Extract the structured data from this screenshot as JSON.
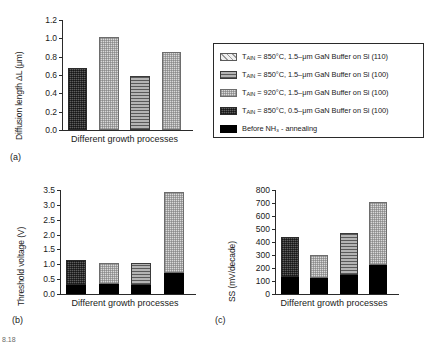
{
  "figure": {
    "panel_a_label": "(a)",
    "panel_b_label": "(b)",
    "panel_c_label": "(c)",
    "xaxis_caption": "Different growth processes",
    "footer_partial": "8.18"
  },
  "legend": {
    "entries": [
      {
        "pattern": "diagonal-hatch",
        "prefix": "T",
        "subscript": "AlN",
        "text": " = 850°C, 1.5–μm GaN Buffer on Si (110)"
      },
      {
        "pattern": "horizontal-lines",
        "prefix": "T",
        "subscript": "AlN",
        "text": " = 850°C, 1.5–μm GaN Buffer on Si (100)"
      },
      {
        "pattern": "checker",
        "prefix": "T",
        "subscript": "AlN",
        "text": " = 920°C, 1.5–μm GaN Buffer on Si (100)"
      },
      {
        "pattern": "dense-grid",
        "prefix": "T",
        "subscript": "AlN",
        "text": " = 850°C, 0.5–μm GaN Buffer on Si (100)"
      },
      {
        "pattern": "solid-black",
        "prefix": "",
        "subscript": "",
        "text": "Before NH₃ - annealing"
      }
    ]
  },
  "chart_data": [
    {
      "type": "bar",
      "panel": "a",
      "title": "",
      "xlabel": "Different growth processes",
      "ylabel": "Diffusion length ΔL (μm)",
      "ylim": [
        0.0,
        1.2
      ],
      "yticks": [
        "0.0",
        "0.2",
        "0.4",
        "0.6",
        "0.8",
        "1.0",
        "1.2"
      ],
      "ytick_values": [
        0.0,
        0.2,
        0.4,
        0.6,
        0.8,
        1.0,
        1.2
      ],
      "grid": false,
      "legend_position": "outside-right",
      "categories": [
        "process-1",
        "process-2",
        "process-3",
        "process-4"
      ],
      "values": [
        0.68,
        1.02,
        0.59,
        0.85
      ],
      "patterns": [
        "dense-grid",
        "checker",
        "horizontal-lines",
        "checker"
      ]
    },
    {
      "type": "bar",
      "panel": "b",
      "title": "",
      "xlabel": "Different growth processes",
      "ylabel": "Threshold voltage (V)",
      "ylim": [
        0.0,
        3.5
      ],
      "yticks": [
        "0.0",
        "0.5",
        "1.0",
        "1.5",
        "2.0",
        "2.5",
        "3.0",
        "3.5"
      ],
      "ytick_values": [
        0.0,
        0.5,
        1.0,
        1.5,
        2.0,
        2.5,
        3.0,
        3.5
      ],
      "grid": false,
      "stacked": true,
      "categories": [
        "process-1",
        "process-2",
        "process-3",
        "process-4"
      ],
      "series": [
        {
          "name": "Before NH3 - annealing",
          "pattern": "solid-black",
          "values": [
            0.3,
            0.33,
            0.31,
            0.69
          ]
        },
        {
          "name": "After annealing",
          "pattern": "varies",
          "values": [
            0.83,
            0.73,
            0.75,
            2.73
          ]
        }
      ],
      "totals": [
        1.13,
        1.06,
        1.06,
        3.42
      ],
      "upper_patterns": [
        "dense-grid",
        "checker",
        "horizontal-lines",
        "checker"
      ]
    },
    {
      "type": "bar",
      "panel": "c",
      "title": "",
      "xlabel": "Different growth processes",
      "ylabel": "SS (mV/decade)",
      "ylim": [
        0,
        800
      ],
      "yticks": [
        "0",
        "100",
        "200",
        "300",
        "400",
        "500",
        "600",
        "700",
        "800"
      ],
      "ytick_values": [
        0,
        100,
        200,
        300,
        400,
        500,
        600,
        700,
        800
      ],
      "grid": false,
      "stacked": true,
      "categories": [
        "process-1",
        "process-2",
        "process-3",
        "process-4"
      ],
      "series": [
        {
          "name": "Before NH3 - annealing",
          "pattern": "solid-black",
          "values": [
            128,
            122,
            148,
            220
          ]
        },
        {
          "name": "After annealing",
          "pattern": "varies",
          "values": [
            307,
            178,
            322,
            490
          ]
        }
      ],
      "totals": [
        435,
        300,
        470,
        710
      ],
      "upper_patterns": [
        "dense-grid",
        "checker",
        "horizontal-lines",
        "checker"
      ]
    }
  ]
}
